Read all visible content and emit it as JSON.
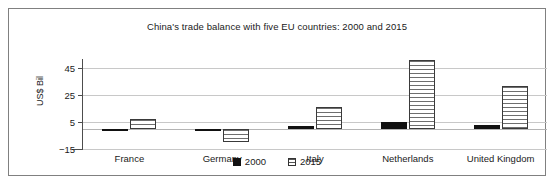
{
  "chart_data": {
    "type": "bar",
    "title": "China's trade balance with five EU countries: 2000 and 2015",
    "xlabel": "",
    "ylabel": "US$ Bil",
    "categories": [
      "France",
      "Germany",
      "Italy",
      "Netherlands",
      "United Kingdom"
    ],
    "series": [
      {
        "name": "2000",
        "values": [
          0,
          0,
          2,
          5,
          3
        ]
      },
      {
        "name": "2015",
        "values": [
          7,
          -10,
          16,
          51,
          32
        ]
      }
    ],
    "ylim": [
      -15,
      52
    ],
    "yticks": [
      45,
      25,
      5,
      -15
    ],
    "ytick_labels": [
      "45",
      "25",
      "5",
      "−15"
    ],
    "grid": true,
    "legend_position": "bottom",
    "colors": {
      "series_2000": "#111111",
      "series_2015": "#ffffff",
      "series_2015_hatch": "#6e6e6e",
      "gridline": "#c8c8c8",
      "axis": "#4d4d4d",
      "frame": "#808080",
      "text": "#1a1a1a"
    }
  },
  "legend": {
    "items": [
      {
        "label": "2000",
        "swatch": "filled-black-square-icon"
      },
      {
        "label": "2015",
        "swatch": "horizontal-striped-square-icon"
      }
    ]
  }
}
